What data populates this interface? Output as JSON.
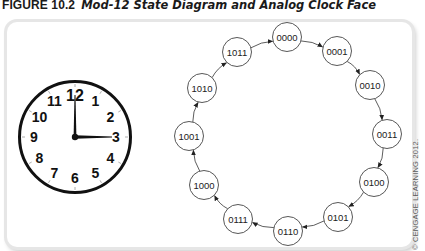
{
  "figure": {
    "number": "FIGURE 10.2",
    "caption": "Mod-12 State Diagram and Analog Clock Face"
  },
  "clock": {
    "numerals": [
      "12",
      "1",
      "2",
      "3",
      "4",
      "5",
      "6",
      "7",
      "8",
      "9",
      "10",
      "11"
    ],
    "time_shown": "3:00",
    "hour_hand_points_to": "3",
    "minute_hand_points_to": "12"
  },
  "state_diagram": {
    "states": [
      "0000",
      "0001",
      "0010",
      "0011",
      "0100",
      "0101",
      "0110",
      "0111",
      "1000",
      "1001",
      "1010",
      "1011"
    ],
    "transitions": [
      [
        "0000",
        "0001"
      ],
      [
        "0001",
        "0010"
      ],
      [
        "0010",
        "0011"
      ],
      [
        "0011",
        "0100"
      ],
      [
        "0100",
        "0101"
      ],
      [
        "0101",
        "0110"
      ],
      [
        "0110",
        "0111"
      ],
      [
        "0111",
        "1000"
      ],
      [
        "1000",
        "1001"
      ],
      [
        "1001",
        "1010"
      ],
      [
        "1010",
        "1011"
      ],
      [
        "1011",
        "0000"
      ]
    ]
  },
  "copyright": "© CENGAGE LEARNING 2012."
}
